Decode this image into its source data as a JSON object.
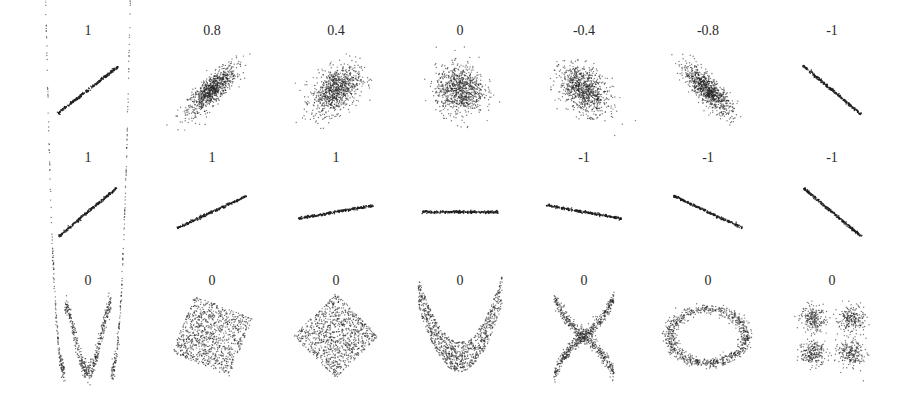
{
  "chart_data": {
    "type": "scatter",
    "title": "",
    "xlabel": "",
    "ylabel": "",
    "grid": false,
    "legend": null,
    "rows": [
      {
        "row": 1,
        "description": "Gaussian clouds with varying correlation",
        "panels": [
          {
            "label": "1",
            "shape": "line",
            "correlation": 1,
            "slope_deg": 38
          },
          {
            "label": "0.8",
            "shape": "cloud",
            "correlation": 0.8
          },
          {
            "label": "0.4",
            "shape": "cloud",
            "correlation": 0.4
          },
          {
            "label": "0",
            "shape": "cloud",
            "correlation": 0
          },
          {
            "label": "-0.4",
            "shape": "cloud",
            "correlation": -0.4
          },
          {
            "label": "-0.8",
            "shape": "cloud",
            "correlation": -0.8
          },
          {
            "label": "-1",
            "shape": "line",
            "correlation": -1,
            "slope_deg": -40
          }
        ]
      },
      {
        "row": 2,
        "description": "Noise-free linear relationships with different slopes",
        "panels": [
          {
            "label": "1",
            "shape": "line",
            "correlation": 1,
            "slope_deg": 40
          },
          {
            "label": "1",
            "shape": "line",
            "correlation": 1,
            "slope_deg": 25
          },
          {
            "label": "1",
            "shape": "line",
            "correlation": 1,
            "slope_deg": 10
          },
          {
            "label": "",
            "shape": "line",
            "correlation": null,
            "slope_deg": 0
          },
          {
            "label": "-1",
            "shape": "line",
            "correlation": -1,
            "slope_deg": -10
          },
          {
            "label": "-1",
            "shape": "line",
            "correlation": -1,
            "slope_deg": -25
          },
          {
            "label": "-1",
            "shape": "line",
            "correlation": -1,
            "slope_deg": -40
          }
        ]
      },
      {
        "row": 3,
        "description": "Nonlinear relationships with zero correlation",
        "panels": [
          {
            "label": "0",
            "shape": "w-curve",
            "correlation": 0
          },
          {
            "label": "0",
            "shape": "rotated-square",
            "correlation": 0,
            "rotation_deg": 22
          },
          {
            "label": "0",
            "shape": "diamond",
            "correlation": 0,
            "rotation_deg": 45
          },
          {
            "label": "0",
            "shape": "parabola",
            "correlation": 0
          },
          {
            "label": "0",
            "shape": "x-curves",
            "correlation": 0
          },
          {
            "label": "0",
            "shape": "ring",
            "correlation": 0
          },
          {
            "label": "0",
            "shape": "four-clusters",
            "correlation": 0
          }
        ]
      }
    ],
    "colors": {
      "points": "#1e1e1e",
      "background": "#ffffff",
      "labels": "#2a2a2a"
    }
  }
}
